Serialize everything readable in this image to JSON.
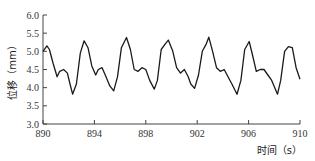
{
  "chart_data": {
    "type": "line",
    "title": "",
    "xlabel": "时间（s）",
    "ylabel": "位移（mm）",
    "xlim": [
      890,
      910
    ],
    "ylim": [
      3.0,
      6.0
    ],
    "xticks": [
      "890",
      "894",
      "898",
      "902",
      "906",
      "910"
    ],
    "yticks": [
      "3.0",
      "3.5",
      "4.0",
      "4.5",
      "5.0",
      "5.5",
      "6.0"
    ],
    "grid": false,
    "legend": null,
    "series": [
      {
        "name": "displacement",
        "color": "#1a1a1a",
        "x": [
          890.0,
          890.3,
          890.5,
          890.8,
          891.1,
          891.3,
          891.6,
          891.9,
          892.1,
          892.3,
          892.6,
          892.9,
          893.2,
          893.5,
          893.8,
          894.1,
          894.3,
          894.6,
          894.9,
          895.2,
          895.5,
          895.8,
          896.1,
          896.5,
          896.8,
          897.1,
          897.4,
          897.7,
          898.0,
          898.3,
          898.66,
          898.9,
          899.2,
          899.5,
          899.75,
          900.1,
          900.4,
          900.7,
          901.0,
          901.3,
          901.5,
          901.8,
          902.1,
          902.4,
          902.7,
          902.9,
          903.2,
          903.5,
          903.8,
          904.1,
          904.4,
          904.7,
          905.1,
          905.4,
          905.7,
          906.05,
          906.3,
          906.6,
          906.9,
          907.2,
          907.5,
          907.8,
          908.25,
          908.5,
          908.8,
          909.1,
          909.4,
          909.7,
          910.0
        ],
        "values": [
          5.0,
          5.15,
          5.05,
          4.65,
          4.3,
          4.45,
          4.5,
          4.4,
          4.1,
          3.82,
          4.1,
          4.95,
          5.29,
          5.1,
          4.6,
          4.35,
          4.5,
          4.55,
          4.3,
          4.05,
          3.91,
          4.3,
          5.1,
          5.38,
          5.05,
          4.5,
          4.45,
          4.55,
          4.5,
          4.2,
          3.96,
          4.2,
          5.05,
          5.2,
          5.31,
          5.0,
          4.55,
          4.4,
          4.5,
          4.3,
          4.1,
          3.98,
          4.35,
          5.0,
          5.2,
          5.39,
          5.0,
          4.55,
          4.45,
          4.5,
          4.3,
          4.1,
          3.82,
          4.2,
          5.05,
          5.27,
          4.9,
          4.45,
          4.5,
          4.5,
          4.35,
          4.2,
          3.82,
          4.2,
          5.0,
          5.13,
          5.1,
          4.55,
          4.23
        ]
      }
    ]
  }
}
